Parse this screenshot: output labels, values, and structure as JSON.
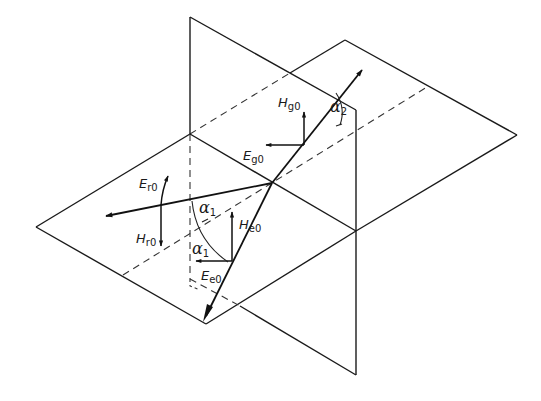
{
  "diagram": {
    "type": "wave-reflection-refraction-at-interface",
    "labels": {
      "incident_E": {
        "main": "E",
        "sub": "e0"
      },
      "incident_H": {
        "main": "H",
        "sub": "e0"
      },
      "reflected_E": {
        "main": "E",
        "sub": "r0"
      },
      "reflected_H": {
        "main": "H",
        "sub": "r0"
      },
      "refracted_E": {
        "main": "E",
        "sub": "g0"
      },
      "refracted_H": {
        "main": "H",
        "sub": "g0"
      },
      "angle_incidence": {
        "main": "α",
        "sub": "1"
      },
      "angle_reflection": {
        "main": "α",
        "sub": "1"
      },
      "angle_refraction": {
        "main": "α",
        "sub": "2"
      }
    },
    "colors": {
      "line": "#1a1a1a",
      "background": "#ffffff"
    }
  }
}
